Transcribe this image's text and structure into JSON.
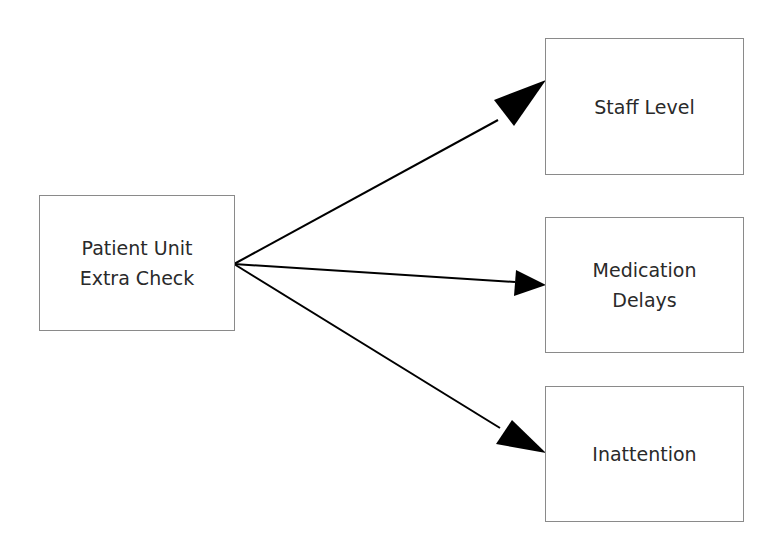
{
  "diagram": {
    "type": "flow",
    "source": {
      "id": "patient-unit-extra-check",
      "lines": [
        "Patient Unit",
        "Extra Check"
      ]
    },
    "targets": [
      {
        "id": "staff-level",
        "lines": [
          "Staff Level"
        ]
      },
      {
        "id": "medication-delays",
        "lines": [
          "Medication",
          "Delays"
        ]
      },
      {
        "id": "inattention",
        "lines": [
          "Inattention"
        ]
      }
    ],
    "edges": [
      {
        "from": "patient-unit-extra-check",
        "to": "staff-level"
      },
      {
        "from": "patient-unit-extra-check",
        "to": "medication-delays"
      },
      {
        "from": "patient-unit-extra-check",
        "to": "inattention"
      }
    ],
    "colors": {
      "box_border": "#8a8a8a",
      "arrow": "#000000",
      "text": "#2a2a2a"
    }
  }
}
